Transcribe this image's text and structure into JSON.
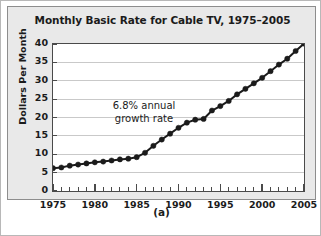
{
  "figure": {
    "caption": "(a)"
  },
  "chart_data": {
    "type": "line",
    "title": "Monthly Basic Rate for Cable TV, 1975–2005",
    "xlabel": "",
    "ylabel": "Dollars Per Month",
    "xlim": [
      1975,
      2005
    ],
    "ylim": [
      0,
      40
    ],
    "grid": true,
    "legend": null,
    "y_ticks": [
      0,
      5,
      10,
      15,
      20,
      25,
      30,
      35,
      40
    ],
    "y_tick_labels": [
      "0",
      "5",
      "10",
      "15",
      "20",
      "25",
      "30",
      "35",
      "40"
    ],
    "x_ticks": [
      1975,
      1980,
      1985,
      1990,
      1995,
      2000,
      2005
    ],
    "x_tick_labels": [
      "1975",
      "1980",
      "1985",
      "1990",
      "1995",
      "2000",
      "2005"
    ],
    "x_minor_tick_step": 1,
    "marker": "filled-circle",
    "line_color": "#1b1b1b",
    "marker_color": "#1b1b1b",
    "annotations": [
      {
        "text_line1": "6.8% annual",
        "text_line2": "growth rate",
        "x": 1983,
        "y": 22
      }
    ],
    "x": [
      1975,
      1976,
      1977,
      1978,
      1979,
      1980,
      1981,
      1982,
      1983,
      1984,
      1985,
      1986,
      1987,
      1988,
      1989,
      1990,
      1991,
      1992,
      1993,
      1994,
      1995,
      1996,
      1997,
      1998,
      1999,
      2000,
      2001,
      2002,
      2003,
      2004,
      2005
    ],
    "values": [
      6.2,
      6.4,
      6.9,
      7.2,
      7.5,
      7.8,
      8.0,
      8.3,
      8.6,
      8.8,
      9.2,
      10.4,
      12.3,
      14.0,
      15.6,
      17.2,
      18.6,
      19.4,
      19.6,
      21.9,
      23.1,
      24.5,
      26.3,
      27.8,
      29.3,
      30.8,
      32.6,
      34.4,
      36.0,
      38.1,
      40.1
    ],
    "series_name": "Monthly basic rate"
  }
}
